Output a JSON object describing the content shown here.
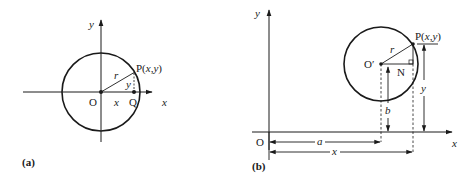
{
  "figure_a": {
    "caption": "(a)",
    "axis_x_label": "x",
    "axis_y_label": "y",
    "origin_label": "O",
    "point_p_label": "P(x,y)",
    "point_q_label": "Q",
    "radius_label": "r",
    "segment_x_label": "x",
    "segment_y_label": "y"
  },
  "figure_b": {
    "caption": "(b)",
    "axis_x_label": "x",
    "axis_y_label": "y",
    "origin_label": "O",
    "center_label": "O′",
    "point_p_label": "P(x,y)",
    "point_n_label": "N",
    "radius_label": "r",
    "dim_a_label": "a",
    "dim_x_label": "x",
    "dim_b_label": "b",
    "dim_y_label": "y"
  },
  "colors": {
    "ink": "#1a1a1a",
    "background": "#ffffff"
  }
}
